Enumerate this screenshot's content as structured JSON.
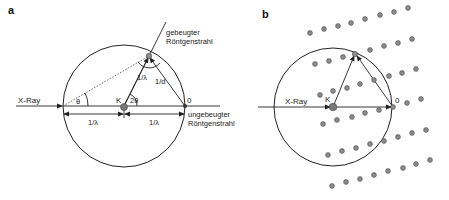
{
  "figure": {
    "panel_a": {
      "label": "a",
      "incoming_beam_label": "X-Ray",
      "center_label": "K",
      "angle_theta_label": "θ",
      "angle_2theta_label": "2θ",
      "origin_label": "0",
      "radius_label": "1/λ",
      "spacing_label": "1/d",
      "left_half_label": "1/λ",
      "right_half_label": "1/λ",
      "diffracted_beam_label_line1": "gebeugter",
      "diffracted_beam_label_line2": "Röntgenstrahl",
      "undiffracted_beam_label_line1": "ungebeugter",
      "undiffracted_beam_label_line2": "Röntgenstrahl"
    },
    "panel_b": {
      "label": "b",
      "incoming_beam_label": "X-Ray",
      "center_label": "K",
      "origin_label": "0",
      "lattice_rows": 6,
      "points_per_row": 8
    },
    "colors": {
      "line": "#222222",
      "lattice_point": "#8c8c8c",
      "background": "#ffffff"
    }
  }
}
